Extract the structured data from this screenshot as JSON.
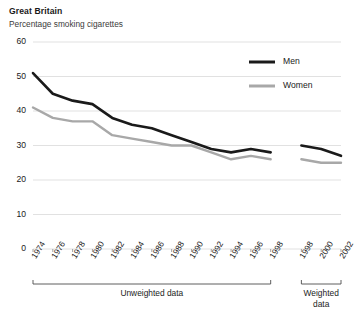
{
  "header": {
    "title": "Great Britain",
    "subtitle": "Percentage smoking cigarettes"
  },
  "legend": {
    "men_label": "Men",
    "women_label": "Women",
    "men_color": "#1a1a1a",
    "women_color": "#a8a8a8"
  },
  "axis_groups": {
    "unweighted_label": "Unweighted data",
    "weighted_label": "Weighted\ndata"
  },
  "chart_data": {
    "type": "line",
    "title": "Great Britain",
    "subtitle": "Percentage smoking cigarettes",
    "xlabel": "",
    "ylabel": "",
    "ylim": [
      0,
      60
    ],
    "yticks": [
      0,
      10,
      20,
      30,
      40,
      50,
      60
    ],
    "grid": true,
    "legend_position": "top-right",
    "x": [
      "1974",
      "1975",
      "1976",
      "1977",
      "1978",
      "1979",
      "1980",
      "1981",
      "1982",
      "1983",
      "1984",
      "1985",
      "1986",
      "1987",
      "1988",
      "1989",
      "1990",
      "1991",
      "1992",
      "1993",
      "1994",
      "1995",
      "1996",
      "1997",
      "1998",
      "1998w",
      "1999",
      "2000",
      "2001",
      "2002"
    ],
    "xticks": [
      "1974",
      "1976",
      "1978",
      "1980",
      "1982",
      "1984",
      "1986",
      "1988",
      "1990",
      "1992",
      "1994",
      "1996",
      "1998",
      "1998",
      "2000",
      "2002"
    ],
    "groups": [
      {
        "label": "Unweighted data",
        "from": "1974",
        "to": "1998"
      },
      {
        "label": "Weighted data",
        "from": "1998w",
        "to": "2002"
      }
    ],
    "series": [
      {
        "name": "Men",
        "color": "#1a1a1a",
        "segments": [
          {
            "group": "Unweighted data",
            "x": [
              "1974",
              "1976",
              "1978",
              "1980",
              "1982",
              "1984",
              "1986",
              "1988",
              "1990",
              "1992",
              "1994",
              "1996",
              "1998"
            ],
            "values": [
              51,
              45,
              43,
              42,
              38,
              36,
              35,
              33,
              31,
              29,
              28,
              29,
              28
            ]
          },
          {
            "group": "Weighted data",
            "x": [
              "1998",
              "2000",
              "2002"
            ],
            "values": [
              30,
              29,
              27
            ]
          }
        ]
      },
      {
        "name": "Women",
        "color": "#a8a8a8",
        "segments": [
          {
            "group": "Unweighted data",
            "x": [
              "1974",
              "1976",
              "1978",
              "1980",
              "1982",
              "1984",
              "1986",
              "1988",
              "1990",
              "1992",
              "1994",
              "1996",
              "1998"
            ],
            "values": [
              41,
              38,
              37,
              37,
              33,
              32,
              31,
              30,
              30,
              28,
              26,
              27,
              26
            ]
          },
          {
            "group": "Weighted data",
            "x": [
              "1998",
              "2000",
              "2002"
            ],
            "values": [
              26,
              25,
              25
            ]
          }
        ]
      }
    ]
  }
}
